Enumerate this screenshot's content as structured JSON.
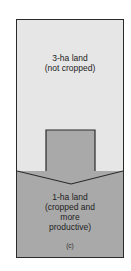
{
  "diagram": {
    "top_region": {
      "line1": "3-ha land",
      "line2": "(not cropped)"
    },
    "bottom_region": {
      "line1": "1-ha land",
      "line2": "(cropped and",
      "line3": "more",
      "line4": "productive)"
    },
    "panel_label": "(c)",
    "colors": {
      "top_fill": "#e6e6e6",
      "arrow_fill": "#a9a9a9",
      "border": "#2a2a2a"
    }
  }
}
